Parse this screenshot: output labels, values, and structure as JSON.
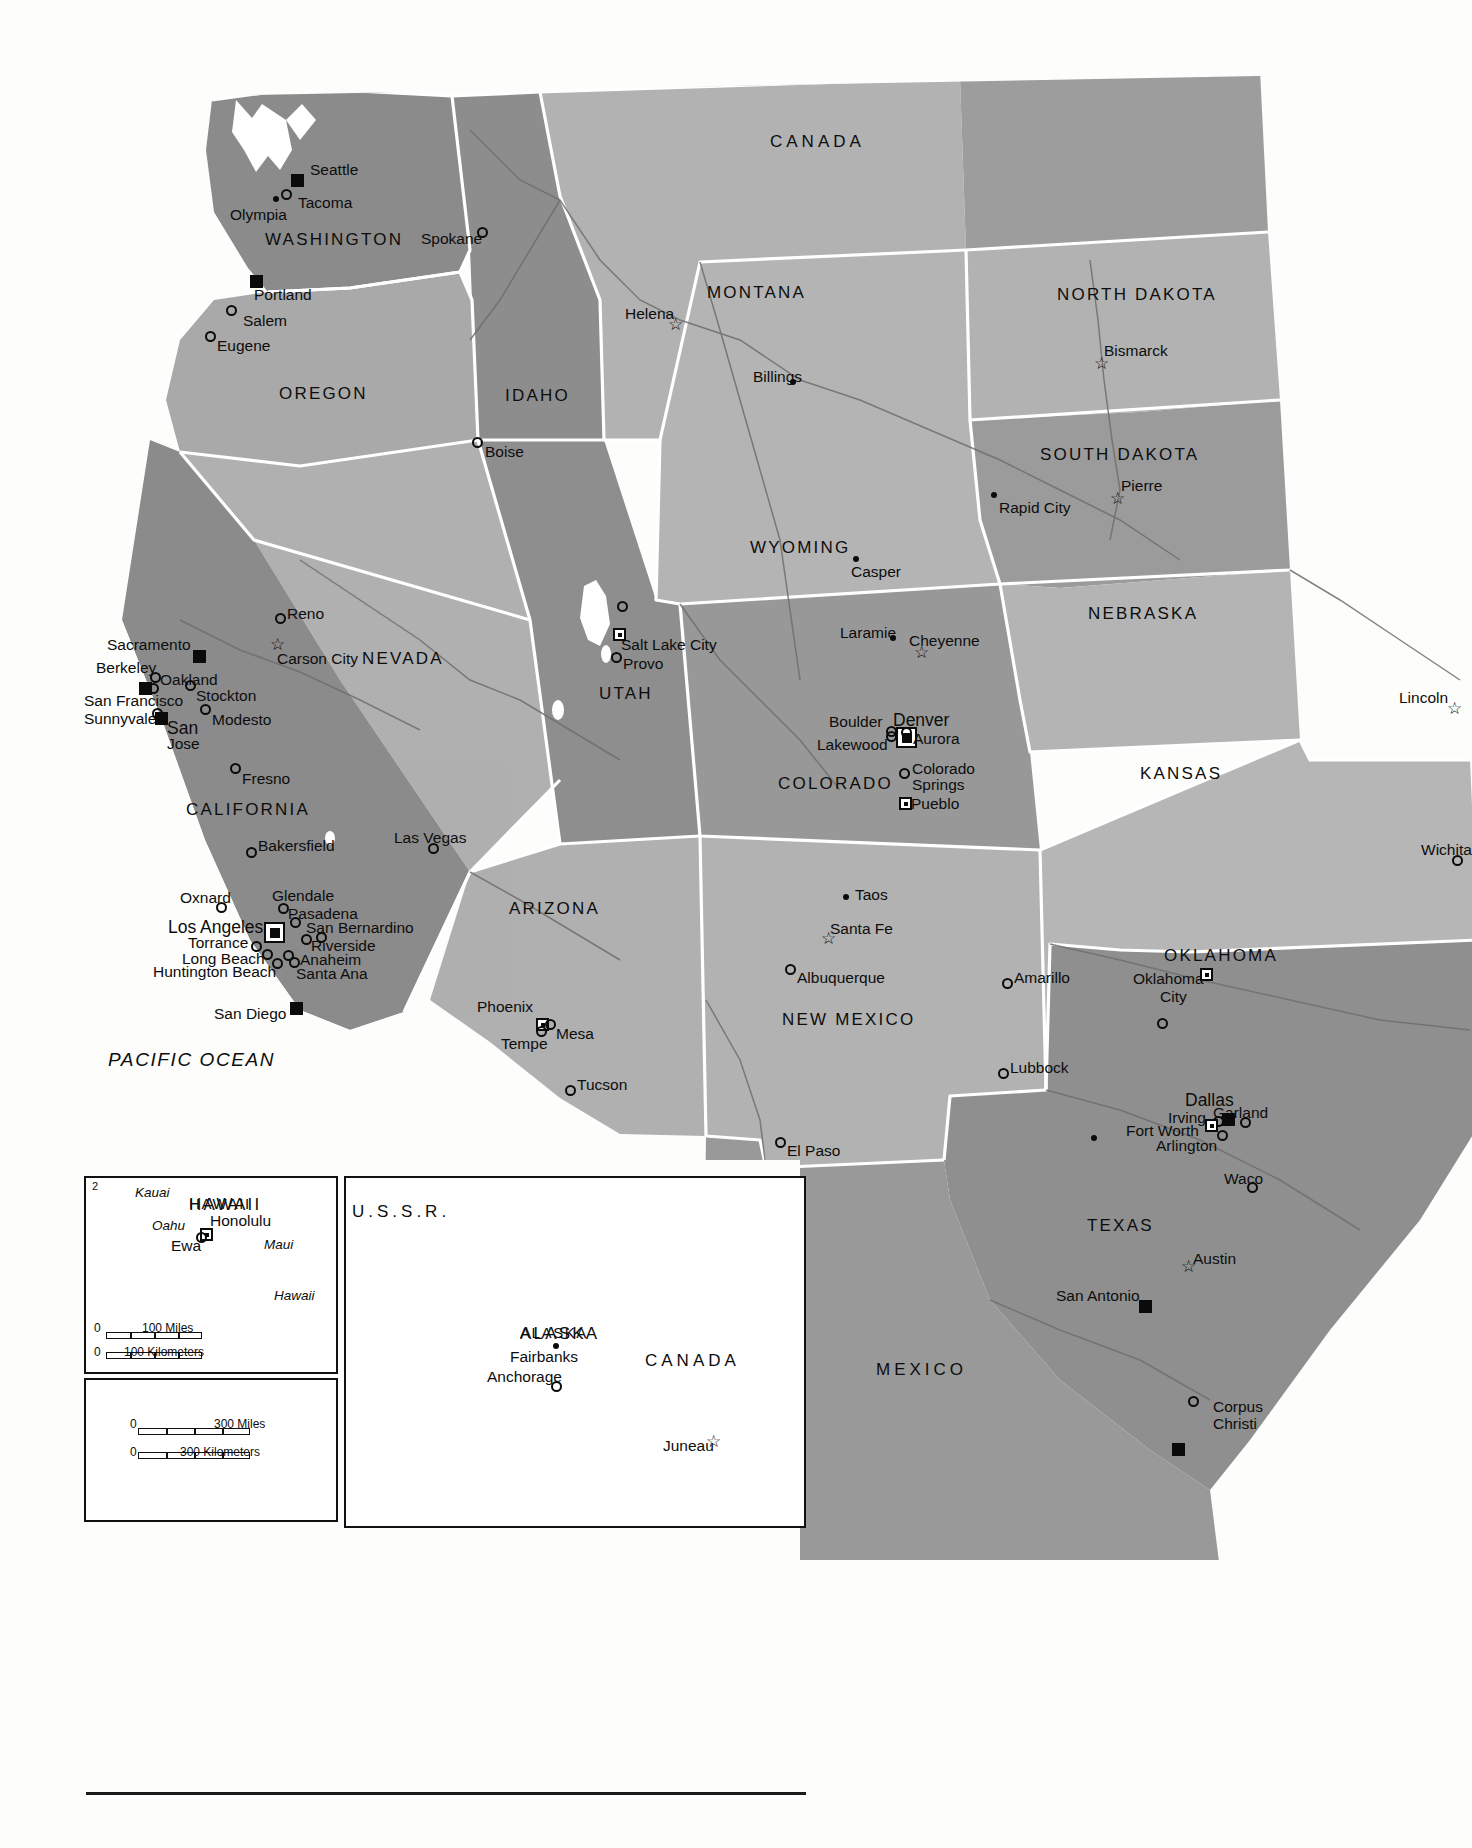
{
  "title": "United States Political Map",
  "countries": [
    {
      "name": "CANADA",
      "x": 770,
      "y": 133
    },
    {
      "name": "MEXICO",
      "x": 876,
      "y": 1361
    },
    {
      "name": "CANADA",
      "x": 645,
      "y": 1352
    },
    {
      "name": "U.S.S.R.",
      "x": 352,
      "y": 1203
    }
  ],
  "oceans": [
    {
      "name": "PACIFIC  OCEAN",
      "x": 108,
      "y": 1050
    }
  ],
  "states": [
    {
      "name": "WASHINGTON",
      "x": 265,
      "y": 231
    },
    {
      "name": "OREGON",
      "x": 279,
      "y": 385
    },
    {
      "name": "IDAHO",
      "x": 505,
      "y": 387
    },
    {
      "name": "MONTANA",
      "x": 707,
      "y": 284
    },
    {
      "name": "NORTH DAKOTA",
      "x": 1057,
      "y": 286
    },
    {
      "name": "SOUTH  DAKOTA",
      "x": 1040,
      "y": 446
    },
    {
      "name": "WYOMING",
      "x": 750,
      "y": 539
    },
    {
      "name": "NEBRASKA",
      "x": 1088,
      "y": 605
    },
    {
      "name": "NEVADA",
      "x": 362,
      "y": 650
    },
    {
      "name": "UTAH",
      "x": 599,
      "y": 685
    },
    {
      "name": "COLORADO",
      "x": 778,
      "y": 775
    },
    {
      "name": "KANSAS",
      "x": 1140,
      "y": 765
    },
    {
      "name": "CALIFORNIA",
      "x": 186,
      "y": 801
    },
    {
      "name": "ARIZONA",
      "x": 509,
      "y": 900
    },
    {
      "name": "NEW MEXICO",
      "x": 782,
      "y": 1011
    },
    {
      "name": "OKLAHOMA",
      "x": 1164,
      "y": 947
    },
    {
      "name": "TEXAS",
      "x": 1087,
      "y": 1217
    },
    {
      "name": "ALASKA",
      "x": 520,
      "y": 1325
    },
    {
      "name": "HAWAII",
      "x": 189,
      "y": 1196
    }
  ],
  "cities": [
    {
      "name": "Seattle",
      "lx": 310,
      "ly": 162,
      "mx": 291,
      "my": 174,
      "type": "square",
      "anchor": "left"
    },
    {
      "name": "Tacoma",
      "lx": 298,
      "ly": 195,
      "mx": 281,
      "my": 189,
      "type": "circle",
      "anchor": "left"
    },
    {
      "name": "Olympia",
      "lx": 230,
      "ly": 207,
      "mx": 273,
      "my": 196,
      "type": "dot",
      "anchor": "left"
    },
    {
      "name": "Spokane",
      "lx": 421,
      "ly": 231,
      "mx": 477,
      "my": 227,
      "type": "circle",
      "anchor": "left"
    },
    {
      "name": "Portland",
      "lx": 254,
      "ly": 287,
      "mx": 250,
      "my": 275,
      "type": "square",
      "anchor": "left"
    },
    {
      "name": "Salem",
      "lx": 243,
      "ly": 313,
      "mx": 226,
      "my": 305,
      "type": "circle",
      "anchor": "left"
    },
    {
      "name": "Eugene",
      "lx": 217,
      "ly": 338,
      "mx": 205,
      "my": 331,
      "type": "circle",
      "anchor": "left"
    },
    {
      "name": "Boise",
      "lx": 485,
      "ly": 444,
      "mx": 472,
      "my": 437,
      "type": "circle",
      "anchor": "left"
    },
    {
      "name": "Helena",
      "lx": 625,
      "ly": 306,
      "mx": 668,
      "my": 316,
      "type": "star",
      "anchor": "left"
    },
    {
      "name": "Billings",
      "lx": 753,
      "ly": 369,
      "mx": 790,
      "my": 379,
      "type": "dot",
      "anchor": "left"
    },
    {
      "name": "Bismarck",
      "lx": 1104,
      "ly": 343,
      "mx": 1094,
      "my": 355,
      "type": "star",
      "anchor": "left"
    },
    {
      "name": "Pierre",
      "lx": 1121,
      "ly": 478,
      "mx": 1110,
      "my": 490,
      "type": "star",
      "anchor": "left"
    },
    {
      "name": "Rapid City",
      "lx": 999,
      "ly": 500,
      "mx": 991,
      "my": 492,
      "type": "dot",
      "anchor": "left"
    },
    {
      "name": "Casper",
      "lx": 851,
      "ly": 564,
      "mx": 853,
      "my": 556,
      "type": "dot",
      "anchor": "left"
    },
    {
      "name": "Laramie",
      "lx": 840,
      "ly": 625,
      "mx": 890,
      "my": 635,
      "type": "dot",
      "anchor": "left"
    },
    {
      "name": "Cheyenne",
      "lx": 909,
      "ly": 633,
      "mx": 914,
      "my": 644,
      "type": "star",
      "anchor": "left"
    },
    {
      "name": "Lincoln",
      "lx": 1399,
      "ly": 690,
      "mx": 1447,
      "my": 700,
      "type": "star",
      "anchor": "left"
    },
    {
      "name": "Reno",
      "lx": 287,
      "ly": 606,
      "mx": 275,
      "my": 613,
      "type": "circle",
      "anchor": "left"
    },
    {
      "name": "Carson City",
      "lx": 277,
      "ly": 651,
      "mx": 270,
      "my": 636,
      "type": "star",
      "anchor": "left"
    },
    {
      "name": "Sacramento",
      "lx": 107,
      "ly": 637,
      "mx": 193,
      "my": 650,
      "type": "square",
      "anchor": "left"
    },
    {
      "name": "Berkeley",
      "lx": 96,
      "ly": 660,
      "mx": 150,
      "my": 672,
      "type": "circle",
      "anchor": "left"
    },
    {
      "name": "Oakland",
      "lx": 160,
      "ly": 672,
      "mx": 148,
      "my": 683,
      "type": "circle",
      "anchor": "left"
    },
    {
      "name": "San Francisco",
      "lx": 84,
      "ly": 693,
      "mx": 139,
      "my": 682,
      "type": "square",
      "anchor": "left"
    },
    {
      "name": "Stockton",
      "lx": 196,
      "ly": 688,
      "mx": 185,
      "my": 680,
      "type": "circle",
      "anchor": "left"
    },
    {
      "name": "Sunnyvale",
      "lx": 84,
      "ly": 711,
      "mx": 152,
      "my": 708,
      "type": "circle",
      "anchor": "left"
    },
    {
      "name": "San",
      "lx": 167,
      "ly": 720,
      "mx": 155,
      "my": 712,
      "type": "square",
      "anchor": "left"
    },
    {
      "name": "Jose",
      "lx": 167,
      "ly": 736,
      "mx": 0,
      "my": 0,
      "type": "none",
      "anchor": "left"
    },
    {
      "name": "Modesto",
      "lx": 212,
      "ly": 712,
      "mx": 200,
      "my": 704,
      "type": "circle",
      "anchor": "left"
    },
    {
      "name": "Fresno",
      "lx": 242,
      "ly": 771,
      "mx": 230,
      "my": 763,
      "type": "circle",
      "anchor": "left"
    },
    {
      "name": "Bakersfield",
      "lx": 258,
      "ly": 838,
      "mx": 246,
      "my": 847,
      "type": "circle",
      "anchor": "left"
    },
    {
      "name": "Las Vegas",
      "lx": 394,
      "ly": 830,
      "mx": 428,
      "my": 843,
      "type": "circle",
      "anchor": "left"
    },
    {
      "name": "Oxnard",
      "lx": 180,
      "ly": 890,
      "mx": 216,
      "my": 902,
      "type": "circle",
      "anchor": "left"
    },
    {
      "name": "Glendale",
      "lx": 272,
      "ly": 888,
      "mx": 278,
      "my": 903,
      "type": "circle",
      "anchor": "left"
    },
    {
      "name": "Pasadena",
      "lx": 288,
      "ly": 906,
      "mx": 290,
      "my": 917,
      "type": "circle",
      "anchor": "left"
    },
    {
      "name": "Los Angeles",
      "lx": 168,
      "ly": 919,
      "mx": 264,
      "my": 922,
      "type": "capbig",
      "anchor": "left"
    },
    {
      "name": "San Bernardino",
      "lx": 306,
      "ly": 920,
      "mx": 316,
      "my": 932,
      "type": "circle",
      "anchor": "left"
    },
    {
      "name": "Torrance",
      "lx": 188,
      "ly": 935,
      "mx": 251,
      "my": 941,
      "type": "circle",
      "anchor": "left"
    },
    {
      "name": "Riverside",
      "lx": 311,
      "ly": 938,
      "mx": 301,
      "my": 934,
      "type": "circle",
      "anchor": "left"
    },
    {
      "name": "Long Beach",
      "lx": 182,
      "ly": 951,
      "mx": 262,
      "my": 949,
      "type": "circle",
      "anchor": "left"
    },
    {
      "name": "Anaheim",
      "lx": 300,
      "ly": 952,
      "mx": 283,
      "my": 950,
      "type": "circle",
      "anchor": "left"
    },
    {
      "name": "Huntington Beach",
      "lx": 153,
      "ly": 964,
      "mx": 272,
      "my": 958,
      "type": "circle",
      "anchor": "left"
    },
    {
      "name": "Santa Ana",
      "lx": 296,
      "ly": 966,
      "mx": 289,
      "my": 957,
      "type": "circle",
      "anchor": "left"
    },
    {
      "name": "San Diego",
      "lx": 214,
      "ly": 1006,
      "mx": 290,
      "my": 1002,
      "type": "square",
      "anchor": "left"
    },
    {
      "name": "Phoenix",
      "lx": 477,
      "ly": 999,
      "mx": 536,
      "my": 1018,
      "type": "cap",
      "anchor": "left"
    },
    {
      "name": "Mesa",
      "lx": 556,
      "ly": 1026,
      "mx": 545,
      "my": 1019,
      "type": "circle",
      "anchor": "left"
    },
    {
      "name": "Tempe",
      "lx": 501,
      "ly": 1036,
      "mx": 536,
      "my": 1026,
      "type": "circle",
      "anchor": "left"
    },
    {
      "name": "Tucson",
      "lx": 577,
      "ly": 1077,
      "mx": 565,
      "my": 1085,
      "type": "circle",
      "anchor": "left"
    },
    {
      "name": "Salt Lake City",
      "lx": 621,
      "ly": 637,
      "mx": 613,
      "my": 628,
      "type": "cap",
      "anchor": "left"
    },
    {
      "name": "Provo",
      "lx": 623,
      "ly": 656,
      "mx": 611,
      "my": 652,
      "type": "circle",
      "anchor": "left"
    },
    {
      "name": "Boulder",
      "lx": 829,
      "ly": 714,
      "mx": 886,
      "my": 726,
      "type": "circle",
      "anchor": "left"
    },
    {
      "name": "Denver",
      "lx": 893,
      "ly": 712,
      "mx": 896,
      "my": 727,
      "type": "capbig",
      "anchor": "left"
    },
    {
      "name": "Aurora",
      "lx": 913,
      "ly": 731,
      "mx": 901,
      "my": 727,
      "type": "circle",
      "anchor": "left"
    },
    {
      "name": "Lakewood",
      "lx": 817,
      "ly": 737,
      "mx": 886,
      "my": 731,
      "type": "circle",
      "anchor": "left"
    },
    {
      "name": "Colorado",
      "lx": 912,
      "ly": 761,
      "mx": 899,
      "my": 768,
      "type": "circle",
      "anchor": "left"
    },
    {
      "name": "Springs",
      "lx": 912,
      "ly": 777,
      "mx": 0,
      "my": 0,
      "type": "none",
      "anchor": "left"
    },
    {
      "name": "Pueblo",
      "lx": 911,
      "ly": 796,
      "mx": 899,
      "my": 797,
      "type": "cap",
      "anchor": "left"
    },
    {
      "name": "Taos",
      "lx": 855,
      "ly": 887,
      "mx": 843,
      "my": 894,
      "type": "dot",
      "anchor": "left"
    },
    {
      "name": "Santa Fe",
      "lx": 830,
      "ly": 921,
      "mx": 821,
      "my": 930,
      "type": "star",
      "anchor": "left"
    },
    {
      "name": "Albuquerque",
      "lx": 797,
      "ly": 970,
      "mx": 785,
      "my": 964,
      "type": "circle",
      "anchor": "left"
    },
    {
      "name": "El Paso",
      "lx": 787,
      "ly": 1143,
      "mx": 775,
      "my": 1137,
      "type": "circle",
      "anchor": "left"
    },
    {
      "name": "Amarillo",
      "lx": 1014,
      "ly": 970,
      "mx": 1002,
      "my": 978,
      "type": "circle",
      "anchor": "left"
    },
    {
      "name": "Oklahoma",
      "lx": 1133,
      "ly": 971,
      "mx": 1200,
      "my": 968,
      "type": "cap",
      "anchor": "left"
    },
    {
      "name": "City",
      "lx": 1160,
      "ly": 989,
      "mx": 0,
      "my": 0,
      "type": "none",
      "anchor": "left"
    },
    {
      "name": "Lubbock",
      "lx": 1010,
      "ly": 1060,
      "mx": 998,
      "my": 1068,
      "type": "circle",
      "anchor": "left"
    },
    {
      "name": "Wichita",
      "lx": 1421,
      "ly": 842,
      "mx": 1452,
      "my": 855,
      "type": "circle",
      "anchor": "left"
    },
    {
      "name": "Garland",
      "lx": 1213,
      "ly": 1105,
      "mx": 1240,
      "my": 1117,
      "type": "circle",
      "anchor": "left"
    },
    {
      "name": "Dallas",
      "lx": 1185,
      "ly": 1092,
      "mx": 1222,
      "my": 1113,
      "type": "square",
      "anchor": "left"
    },
    {
      "name": "Irving",
      "lx": 1168,
      "ly": 1110,
      "mx": 1213,
      "my": 1116,
      "type": "circle",
      "anchor": "left"
    },
    {
      "name": "Fort Worth",
      "lx": 1126,
      "ly": 1123,
      "mx": 1205,
      "my": 1119,
      "type": "cap",
      "anchor": "left"
    },
    {
      "name": "Arlington",
      "lx": 1156,
      "ly": 1138,
      "mx": 1217,
      "my": 1130,
      "type": "circle",
      "anchor": "left"
    },
    {
      "name": "Waco",
      "lx": 1224,
      "ly": 1171,
      "mx": 1247,
      "my": 1182,
      "type": "circle",
      "anchor": "left"
    },
    {
      "name": "Austin",
      "lx": 1193,
      "ly": 1251,
      "mx": 1181,
      "my": 1258,
      "type": "star",
      "anchor": "left"
    },
    {
      "name": "San Antonio",
      "lx": 1056,
      "ly": 1288,
      "mx": 1139,
      "my": 1300,
      "type": "square",
      "anchor": "left"
    },
    {
      "name": "Corpus",
      "lx": 1213,
      "ly": 1399,
      "mx": 1188,
      "my": 1396,
      "type": "circle",
      "anchor": "left"
    },
    {
      "name": "Christi",
      "lx": 1213,
      "ly": 1416,
      "mx": 0,
      "my": 0,
      "type": "none",
      "anchor": "left"
    }
  ],
  "unlabeled_markers": [
    {
      "x": 617,
      "y": 601,
      "type": "circle"
    },
    {
      "x": 1157,
      "y": 1018,
      "type": "circle"
    },
    {
      "x": 1091,
      "y": 1135,
      "type": "dot"
    },
    {
      "x": 1172,
      "y": 1443,
      "type": "square"
    }
  ],
  "hawaii_inset": {
    "title": "HAWAII",
    "islands": [
      {
        "name": "Kauai",
        "x": 135,
        "y": 1186
      },
      {
        "name": "Oahu",
        "x": 152,
        "y": 1219
      },
      {
        "name": "Maui",
        "x": 264,
        "y": 1238
      },
      {
        "name": "Hawaii",
        "x": 274,
        "y": 1289
      }
    ],
    "cities": [
      {
        "name": "Honolulu",
        "lx": 210,
        "ly": 1213,
        "mx": 200,
        "my": 1228,
        "type": "cap"
      },
      {
        "name": "Ewa",
        "lx": 171,
        "ly": 1238,
        "mx": 196,
        "my": 1232,
        "type": "circle"
      }
    ],
    "corner_number": "2",
    "scale_miles_zero": "0",
    "scale_miles_label": "100 Miles",
    "scale_km_zero": "0",
    "scale_km_label": "100 Kilometers"
  },
  "alaska_inset": {
    "title": "ALASKA",
    "neighbors": [
      {
        "name": "U.S.S.R.",
        "x": 352,
        "y": 1203
      },
      {
        "name": "CANADA",
        "x": 645,
        "y": 1352
      }
    ],
    "cities": [
      {
        "name": "Fairbanks",
        "lx": 510,
        "ly": 1349,
        "mx": 553,
        "my": 1343,
        "type": "dot"
      },
      {
        "name": "Anchorage",
        "lx": 487,
        "ly": 1369,
        "mx": 551,
        "my": 1381,
        "type": "circle"
      },
      {
        "name": "Juneau",
        "lx": 663,
        "ly": 1438,
        "mx": 706,
        "my": 1433,
        "type": "star"
      }
    ]
  },
  "scale_box": {
    "miles_zero": "0",
    "miles_label": "300 Miles",
    "km_zero": "0",
    "km_label": "300 Kilometers"
  },
  "colors": {
    "land_dark": "#8e8e8e",
    "land_mid": "#9b9b9b",
    "land_light": "#b0b0b0",
    "land_lighter": "#a5a5a5",
    "water": "#ffffff",
    "border": "#ffffff",
    "ink": "#0d0d0d"
  }
}
